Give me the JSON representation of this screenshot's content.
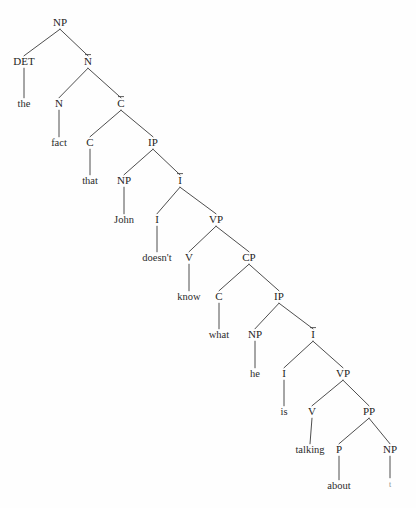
{
  "figure": {
    "kind": "x-bar-syntax-tree",
    "sentence": "the fact that John doesn't know what he is talking about",
    "background_color": "#fefefe",
    "line_color": "#3a3a3a",
    "text_color": "#242424",
    "trace_color": "#8a8a8a",
    "width": 416,
    "height": 508
  },
  "chart_data": {
    "type": "diagram",
    "xlabel": "",
    "ylabel": "",
    "nodes": [
      {
        "id": "n0",
        "label": "NP",
        "bar": false,
        "terminal": false,
        "x": 60,
        "y": 26
      },
      {
        "id": "n1",
        "label": "DET",
        "bar": false,
        "terminal": false,
        "x": 24,
        "y": 65
      },
      {
        "id": "n2",
        "label": "N",
        "bar": true,
        "terminal": false,
        "x": 88,
        "y": 65
      },
      {
        "id": "n3",
        "label": "the",
        "bar": false,
        "terminal": true,
        "x": 24,
        "y": 107
      },
      {
        "id": "n4",
        "label": "N",
        "bar": false,
        "terminal": false,
        "x": 59,
        "y": 107
      },
      {
        "id": "n5",
        "label": "C",
        "bar": true,
        "terminal": false,
        "x": 121,
        "y": 107
      },
      {
        "id": "n6",
        "label": "fact",
        "bar": false,
        "terminal": true,
        "x": 59,
        "y": 146
      },
      {
        "id": "n7",
        "label": "C",
        "bar": false,
        "terminal": false,
        "x": 90,
        "y": 146
      },
      {
        "id": "n8",
        "label": "IP",
        "bar": false,
        "terminal": false,
        "x": 153,
        "y": 146
      },
      {
        "id": "n9",
        "label": "that",
        "bar": false,
        "terminal": true,
        "x": 90,
        "y": 184
      },
      {
        "id": "n10",
        "label": "NP",
        "bar": false,
        "terminal": false,
        "x": 124,
        "y": 184
      },
      {
        "id": "n11",
        "label": "I",
        "bar": true,
        "terminal": false,
        "x": 180,
        "y": 184
      },
      {
        "id": "n12",
        "label": "John",
        "bar": false,
        "terminal": true,
        "x": 124,
        "y": 223
      },
      {
        "id": "n13",
        "label": "I",
        "bar": false,
        "terminal": false,
        "x": 157,
        "y": 223
      },
      {
        "id": "n14",
        "label": "VP",
        "bar": false,
        "terminal": false,
        "x": 216,
        "y": 223
      },
      {
        "id": "n15",
        "label": "doesn't",
        "bar": false,
        "terminal": true,
        "x": 157,
        "y": 261
      },
      {
        "id": "n16",
        "label": "V",
        "bar": false,
        "terminal": false,
        "x": 189,
        "y": 261
      },
      {
        "id": "n17",
        "label": "CP",
        "bar": false,
        "terminal": false,
        "x": 249,
        "y": 261
      },
      {
        "id": "n18",
        "label": "know",
        "bar": false,
        "terminal": true,
        "x": 189,
        "y": 300
      },
      {
        "id": "n19",
        "label": "C",
        "bar": false,
        "terminal": false,
        "x": 219,
        "y": 300
      },
      {
        "id": "n20",
        "label": "IP",
        "bar": false,
        "terminal": false,
        "x": 279,
        "y": 300
      },
      {
        "id": "n21",
        "label": "what",
        "bar": false,
        "terminal": true,
        "x": 219,
        "y": 338
      },
      {
        "id": "n22",
        "label": "NP",
        "bar": false,
        "terminal": false,
        "x": 255,
        "y": 338
      },
      {
        "id": "n23",
        "label": "I",
        "bar": true,
        "terminal": false,
        "x": 313,
        "y": 338
      },
      {
        "id": "n24",
        "label": "he",
        "bar": false,
        "terminal": true,
        "x": 255,
        "y": 377
      },
      {
        "id": "n25",
        "label": "I",
        "bar": false,
        "terminal": false,
        "x": 284,
        "y": 377
      },
      {
        "id": "n26",
        "label": "VP",
        "bar": false,
        "terminal": false,
        "x": 343,
        "y": 377
      },
      {
        "id": "n27",
        "label": "is",
        "bar": false,
        "terminal": true,
        "x": 284,
        "y": 415
      },
      {
        "id": "n28",
        "label": "V",
        "bar": false,
        "terminal": false,
        "x": 312,
        "y": 415
      },
      {
        "id": "n29",
        "label": "PP",
        "bar": false,
        "terminal": false,
        "x": 369,
        "y": 415
      },
      {
        "id": "n30",
        "label": "talking",
        "bar": false,
        "terminal": true,
        "x": 310,
        "y": 453
      },
      {
        "id": "n31",
        "label": "P",
        "bar": false,
        "terminal": false,
        "x": 339,
        "y": 453
      },
      {
        "id": "n32",
        "label": "NP",
        "bar": false,
        "terminal": false,
        "x": 390,
        "y": 453
      },
      {
        "id": "n33",
        "label": "about",
        "bar": false,
        "terminal": true,
        "x": 339,
        "y": 489
      },
      {
        "id": "n34",
        "label": "t",
        "bar": false,
        "terminal": true,
        "trace": true,
        "x": 390,
        "y": 487
      }
    ],
    "edges": [
      {
        "from": "n0",
        "to": "n1"
      },
      {
        "from": "n0",
        "to": "n2"
      },
      {
        "from": "n1",
        "to": "n3"
      },
      {
        "from": "n2",
        "to": "n4"
      },
      {
        "from": "n2",
        "to": "n5"
      },
      {
        "from": "n4",
        "to": "n6"
      },
      {
        "from": "n5",
        "to": "n7"
      },
      {
        "from": "n5",
        "to": "n8"
      },
      {
        "from": "n7",
        "to": "n9"
      },
      {
        "from": "n8",
        "to": "n10"
      },
      {
        "from": "n8",
        "to": "n11"
      },
      {
        "from": "n10",
        "to": "n12"
      },
      {
        "from": "n11",
        "to": "n13"
      },
      {
        "from": "n11",
        "to": "n14"
      },
      {
        "from": "n13",
        "to": "n15"
      },
      {
        "from": "n14",
        "to": "n16"
      },
      {
        "from": "n14",
        "to": "n17"
      },
      {
        "from": "n16",
        "to": "n18"
      },
      {
        "from": "n17",
        "to": "n19"
      },
      {
        "from": "n17",
        "to": "n20"
      },
      {
        "from": "n19",
        "to": "n21"
      },
      {
        "from": "n20",
        "to": "n22"
      },
      {
        "from": "n20",
        "to": "n23"
      },
      {
        "from": "n22",
        "to": "n24"
      },
      {
        "from": "n23",
        "to": "n25"
      },
      {
        "from": "n23",
        "to": "n26"
      },
      {
        "from": "n25",
        "to": "n27"
      },
      {
        "from": "n26",
        "to": "n28"
      },
      {
        "from": "n26",
        "to": "n29"
      },
      {
        "from": "n28",
        "to": "n30"
      },
      {
        "from": "n29",
        "to": "n31"
      },
      {
        "from": "n29",
        "to": "n32"
      },
      {
        "from": "n31",
        "to": "n33"
      },
      {
        "from": "n32",
        "to": "n34"
      }
    ]
  }
}
